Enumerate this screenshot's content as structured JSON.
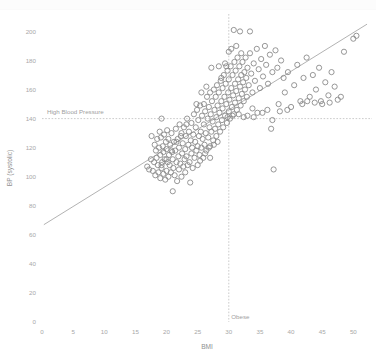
{
  "chart_data": {
    "type": "scatter",
    "title": "",
    "xlabel": "BMI",
    "ylabel": "BP (systolic)",
    "xlim": [
      0,
      53
    ],
    "ylim": [
      0,
      212
    ],
    "grid": false,
    "legend": "none",
    "xticks": [
      0,
      5,
      10,
      15,
      20,
      25,
      30,
      35,
      40,
      45,
      50
    ],
    "xtick_labels": [
      "0",
      "5",
      "10",
      "15",
      "20",
      "25",
      "30",
      "35",
      "40",
      "45",
      "50"
    ],
    "yticks": [
      0,
      20,
      40,
      60,
      80,
      100,
      120,
      140,
      160,
      180,
      200
    ],
    "ytick_labels": [
      "0",
      "20",
      "40",
      "60",
      "80",
      "100",
      "120",
      "140",
      "160",
      "180",
      "200"
    ],
    "marker": {
      "shape": "circle-open",
      "radius": 2.6,
      "stroke_color": "#8b8b8b",
      "fill": "none"
    },
    "reference_lines": [
      {
        "name": "high-blood-pressure",
        "orientation": "horizontal",
        "value": 140,
        "label": "High Blood Pressure",
        "style": "dashed",
        "color": "#b5b5b5"
      },
      {
        "name": "obese",
        "orientation": "vertical",
        "value": 30,
        "label": "Obese",
        "style": "dashed",
        "color": "#b5b5b5"
      }
    ],
    "trend_line": {
      "name": "linear-fit",
      "x": [
        0.3,
        52.2
      ],
      "y": [
        67,
        205
      ],
      "color": "#9e9e9e",
      "style": "solid"
    },
    "series": [
      {
        "name": "patients",
        "color": "#8b8b8b",
        "points": [
          [
            16.9,
            107
          ],
          [
            17.2,
            105
          ],
          [
            17.5,
            112
          ],
          [
            17.6,
            128
          ],
          [
            17.8,
            104
          ],
          [
            18.0,
            110
          ],
          [
            18.1,
            122
          ],
          [
            18.2,
            101
          ],
          [
            18.3,
            118
          ],
          [
            18.4,
            113
          ],
          [
            18.5,
            126
          ],
          [
            18.6,
            108
          ],
          [
            18.7,
            103
          ],
          [
            18.8,
            120
          ],
          [
            18.9,
            131
          ],
          [
            19.0,
            99
          ],
          [
            19.0,
            115
          ],
          [
            19.1,
            127
          ],
          [
            19.2,
            106
          ],
          [
            19.2,
            140
          ],
          [
            19.3,
            110
          ],
          [
            19.4,
            121
          ],
          [
            19.5,
            102
          ],
          [
            19.5,
            117
          ],
          [
            19.6,
            129
          ],
          [
            19.7,
            112
          ],
          [
            19.8,
            98
          ],
          [
            19.9,
            124
          ],
          [
            20.0,
            104
          ],
          [
            20.0,
            119
          ],
          [
            20.1,
            132
          ],
          [
            20.2,
            110
          ],
          [
            20.3,
            100
          ],
          [
            20.3,
            126
          ],
          [
            20.4,
            115
          ],
          [
            20.5,
            108
          ],
          [
            20.6,
            122
          ],
          [
            20.7,
            103
          ],
          [
            20.8,
            130
          ],
          [
            20.9,
            117
          ],
          [
            21.0,
            90
          ],
          [
            21.0,
            112
          ],
          [
            21.1,
            106
          ],
          [
            21.2,
            124
          ],
          [
            21.3,
            101
          ],
          [
            21.4,
            118
          ],
          [
            21.5,
            133
          ],
          [
            21.6,
            110
          ],
          [
            21.7,
            97
          ],
          [
            21.8,
            126
          ],
          [
            21.9,
            114
          ],
          [
            22.0,
            105
          ],
          [
            22.0,
            120
          ],
          [
            22.1,
            136
          ],
          [
            22.2,
            109
          ],
          [
            22.3,
            128
          ],
          [
            22.4,
            100
          ],
          [
            22.5,
            116
          ],
          [
            22.6,
            123
          ],
          [
            22.7,
            107
          ],
          [
            22.8,
            134
          ],
          [
            22.9,
            112
          ],
          [
            23.0,
            119
          ],
          [
            23.0,
            103
          ],
          [
            23.1,
            128
          ],
          [
            23.2,
            114
          ],
          [
            23.3,
            140
          ],
          [
            23.4,
            108
          ],
          [
            23.5,
            122
          ],
          [
            23.6,
            131
          ],
          [
            23.7,
            110
          ],
          [
            23.8,
            96
          ],
          [
            23.9,
            125
          ],
          [
            24.0,
            116
          ],
          [
            24.0,
            137
          ],
          [
            24.1,
            120
          ],
          [
            24.2,
            106
          ],
          [
            24.3,
            129
          ],
          [
            24.4,
            143
          ],
          [
            24.5,
            113
          ],
          [
            24.6,
            124
          ],
          [
            24.7,
            134
          ],
          [
            24.8,
            118
          ],
          [
            24.9,
            146
          ],
          [
            25.0,
            121
          ],
          [
            25.0,
            108
          ],
          [
            25.1,
            139
          ],
          [
            25.2,
            128
          ],
          [
            25.3,
            115
          ],
          [
            25.4,
            149
          ],
          [
            25.5,
            131
          ],
          [
            25.6,
            120
          ],
          [
            25.7,
            142
          ],
          [
            25.8,
            126
          ],
          [
            25.9,
            113
          ],
          [
            26.0,
            150
          ],
          [
            26.0,
            136
          ],
          [
            26.1,
            122
          ],
          [
            26.2,
            145
          ],
          [
            26.3,
            130
          ],
          [
            26.4,
            118
          ],
          [
            26.5,
            155
          ],
          [
            26.6,
            140
          ],
          [
            26.7,
            127
          ],
          [
            26.8,
            148
          ],
          [
            26.9,
            134
          ],
          [
            27.0,
            121
          ],
          [
            27.0,
            158
          ],
          [
            27.1,
            143
          ],
          [
            27.2,
            131
          ],
          [
            27.3,
            152
          ],
          [
            27.4,
            138
          ],
          [
            27.5,
            125
          ],
          [
            27.6,
            160
          ],
          [
            27.7,
            146
          ],
          [
            27.8,
            133
          ],
          [
            27.9,
            155
          ],
          [
            28.0,
            141
          ],
          [
            28.0,
            128
          ],
          [
            28.1,
            163
          ],
          [
            28.2,
            149
          ],
          [
            28.3,
            136
          ],
          [
            28.4,
            158
          ],
          [
            28.5,
            144
          ],
          [
            28.6,
            131
          ],
          [
            28.7,
            166
          ],
          [
            28.8,
            152
          ],
          [
            28.9,
            139
          ],
          [
            29.0,
            161
          ],
          [
            29.0,
            147
          ],
          [
            29.1,
            134
          ],
          [
            29.2,
            170
          ],
          [
            29.3,
            155
          ],
          [
            29.4,
            142
          ],
          [
            29.5,
            164
          ],
          [
            29.6,
            150
          ],
          [
            29.7,
            137
          ],
          [
            29.8,
            173
          ],
          [
            29.9,
            158
          ],
          [
            30.0,
            145
          ],
          [
            30.0,
            167
          ],
          [
            30.1,
            153
          ],
          [
            30.2,
            140
          ],
          [
            30.3,
            176
          ],
          [
            30.4,
            161
          ],
          [
            30.5,
            148
          ],
          [
            30.6,
            170
          ],
          [
            30.7,
            156
          ],
          [
            30.8,
            143
          ],
          [
            30.9,
            179
          ],
          [
            31.0,
            164
          ],
          [
            31.0,
            151
          ],
          [
            31.1,
            173
          ],
          [
            31.2,
            159
          ],
          [
            31.3,
            146
          ],
          [
            31.4,
            182
          ],
          [
            31.5,
            167
          ],
          [
            31.6,
            154
          ],
          [
            31.7,
            176
          ],
          [
            31.8,
            162
          ],
          [
            31.9,
            149
          ],
          [
            32.0,
            185
          ],
          [
            32.0,
            170
          ],
          [
            32.1,
            157
          ],
          [
            32.2,
            179
          ],
          [
            32.3,
            165
          ],
          [
            32.4,
            152
          ],
          [
            32.5,
            172
          ],
          [
            32.6,
            160
          ],
          [
            32.7,
            182
          ],
          [
            32.8,
            168
          ],
          [
            32.9,
            155
          ],
          [
            33.0,
            175
          ],
          [
            33.2,
            163
          ],
          [
            33.4,
            185
          ],
          [
            33.6,
            171
          ],
          [
            33.8,
            158
          ],
          [
            34.0,
            178
          ],
          [
            34.2,
            166
          ],
          [
            34.5,
            188
          ],
          [
            34.8,
            174
          ],
          [
            35.0,
            161
          ],
          [
            35.2,
            181
          ],
          [
            35.5,
            169
          ],
          [
            35.8,
            190
          ],
          [
            36.0,
            177
          ],
          [
            36.3,
            164
          ],
          [
            36.6,
            184
          ],
          [
            37.0,
            172
          ],
          [
            37.2,
            105
          ],
          [
            37.5,
            187
          ],
          [
            37.8,
            175
          ],
          [
            38.0,
            150
          ],
          [
            38.4,
            180
          ],
          [
            38.8,
            168
          ],
          [
            39.0,
            158
          ],
          [
            39.5,
            172
          ],
          [
            40.0,
            148
          ],
          [
            40.5,
            163
          ],
          [
            41.0,
            177
          ],
          [
            41.5,
            152
          ],
          [
            42.0,
            168
          ],
          [
            42.5,
            182
          ],
          [
            43.0,
            155
          ],
          [
            43.5,
            170
          ],
          [
            44.0,
            160
          ],
          [
            44.5,
            175
          ],
          [
            45.0,
            150
          ],
          [
            45.5,
            165
          ],
          [
            46.0,
            156
          ],
          [
            46.5,
            172
          ],
          [
            47.0,
            162
          ],
          [
            48.0,
            155
          ],
          [
            48.5,
            186
          ],
          [
            50.0,
            195
          ],
          [
            50.5,
            197
          ],
          [
            27.2,
            175
          ],
          [
            28.4,
            176
          ],
          [
            29.6,
            176
          ],
          [
            30.4,
            188
          ],
          [
            31.2,
            190
          ],
          [
            31.8,
            200
          ],
          [
            30.0,
            186
          ],
          [
            30.8,
            201
          ],
          [
            33.4,
            200
          ],
          [
            29.4,
            178
          ],
          [
            28.8,
            168
          ],
          [
            26.4,
            162
          ],
          [
            25.6,
            158
          ],
          [
            24.8,
            150
          ],
          [
            23.2,
            136
          ],
          [
            22.4,
            130
          ],
          [
            21.6,
            124
          ],
          [
            20.8,
            118
          ],
          [
            20.0,
            112
          ],
          [
            19.2,
            108
          ],
          [
            26.8,
            120
          ],
          [
            27.6,
            122
          ],
          [
            28.2,
            124
          ],
          [
            27.0,
            113
          ],
          [
            26.2,
            116
          ],
          [
            25.4,
            111
          ],
          [
            32.4,
            141
          ],
          [
            33.0,
            142
          ],
          [
            34.0,
            141
          ],
          [
            35.4,
            144
          ],
          [
            36.2,
            146
          ],
          [
            37.0,
            139
          ],
          [
            33.8,
            147
          ],
          [
            34.6,
            144
          ],
          [
            31.6,
            143
          ],
          [
            30.6,
            142
          ],
          [
            29.8,
            141
          ],
          [
            36.8,
            133
          ],
          [
            38.2,
            145
          ],
          [
            39.4,
            146
          ],
          [
            41.8,
            150
          ],
          [
            42.6,
            152
          ],
          [
            43.8,
            151
          ],
          [
            44.8,
            152
          ],
          [
            46.2,
            151
          ],
          [
            47.5,
            153
          ]
        ]
      }
    ]
  }
}
